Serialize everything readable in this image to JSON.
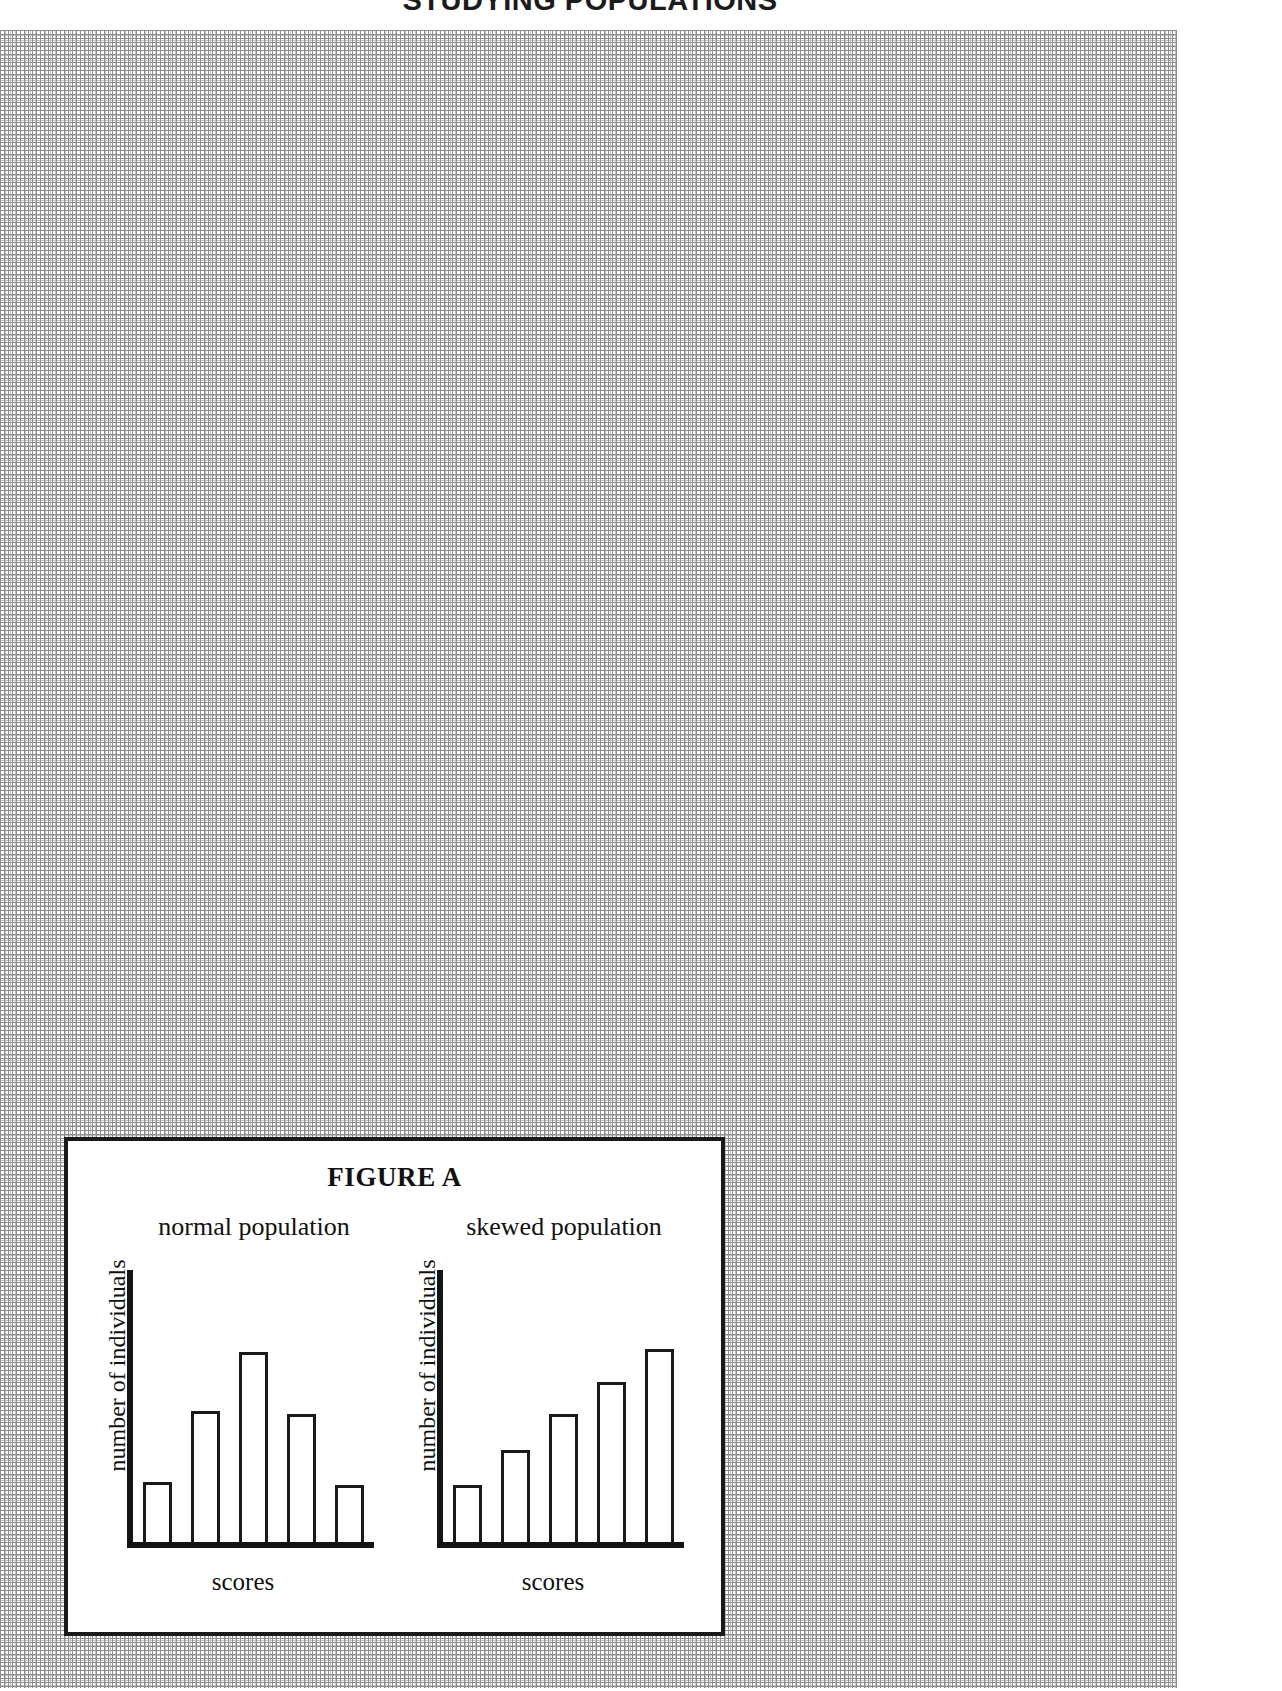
{
  "page": {
    "heading": "STUDYING POPULATIONS",
    "background": "dotted graph paper",
    "grid_color": "#8d8d8d",
    "ink_color": "#1a1a1a"
  },
  "figure": {
    "title": "FIGURE A",
    "border_color": "#1a1a1a"
  },
  "chart_data": [
    {
      "type": "bar",
      "title": "normal population",
      "xlabel": "scores",
      "ylabel": "number of individuals",
      "categories": [
        "1",
        "2",
        "3",
        "4",
        "5"
      ],
      "values": [
        22,
        48,
        70,
        47,
        21
      ],
      "ylim": [
        0,
        100
      ],
      "grid": false,
      "legend": "none",
      "bar_fill": "#ffffff",
      "bar_stroke": "#1a1a1a",
      "notes": "symmetric unimodal distribution, peak in the middle"
    },
    {
      "type": "bar",
      "title": "skewed population",
      "xlabel": "scores",
      "ylabel": "number of individuals",
      "categories": [
        "1",
        "2",
        "3",
        "4",
        "5"
      ],
      "values": [
        21,
        34,
        47,
        59,
        71
      ],
      "ylim": [
        0,
        100
      ],
      "grid": false,
      "legend": "none",
      "bar_fill": "#ffffff",
      "bar_stroke": "#1a1a1a",
      "notes": "monotonically increasing bars, negatively skewed distribution"
    }
  ]
}
